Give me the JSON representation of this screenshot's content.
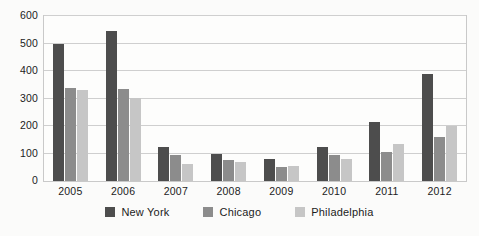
{
  "chart_data": {
    "type": "bar",
    "title": "",
    "subtitle": "",
    "xlabel": "",
    "ylabel": "",
    "categories": [
      "2005",
      "2006",
      "2007",
      "2008",
      "2009",
      "2010",
      "2011",
      "2012"
    ],
    "series": [
      {
        "name": "New York",
        "color": "#4d4d4d",
        "values": [
          500,
          545,
          125,
          97,
          80,
          125,
          215,
          390
        ]
      },
      {
        "name": "Chicago",
        "color": "#8c8c8c",
        "values": [
          340,
          333,
          95,
          75,
          52,
          95,
          107,
          160
        ]
      },
      {
        "name": "Philadelphia",
        "color": "#c6c6c6",
        "values": [
          330,
          303,
          63,
          68,
          55,
          80,
          135,
          200
        ]
      }
    ],
    "ylim": [
      0,
      600
    ],
    "ytick_step": 100,
    "yticks": [
      "600",
      "500",
      "400",
      "300",
      "200",
      "100",
      "0"
    ],
    "grid": true,
    "legend_position": "bottom-center",
    "legend_entries": [
      "New York",
      "Chicago",
      "Philadelphia"
    ]
  }
}
